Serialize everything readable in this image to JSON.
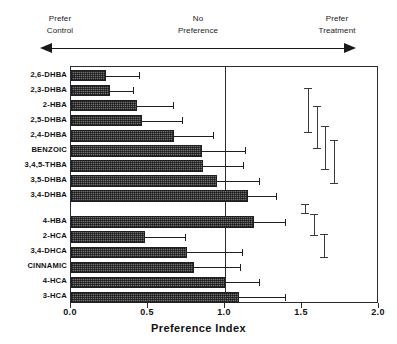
{
  "header": {
    "left_line1": "Prefer",
    "left_line2": "Control",
    "center_line1": "No",
    "center_line2": "Preference",
    "right_line1": "Prefer",
    "right_line2": "Treatment",
    "arrow_left_name": "left-arrow-head",
    "arrow_right_name": "right-arrow-head"
  },
  "chart_data": {
    "type": "bar",
    "orientation": "horizontal",
    "title": "",
    "xlabel": "Preference   Index",
    "ylabel": "",
    "xlim": [
      0.0,
      2.0
    ],
    "xticks": [
      "0.0",
      "0.5",
      "1.0",
      "1.5",
      "2.0"
    ],
    "xtick_values": [
      0.0,
      0.5,
      1.0,
      1.5,
      2.0
    ],
    "grid": false,
    "legend": false,
    "reference_line": 1.0,
    "categories": [
      "2,6-DHBA",
      "2,3-DHBA",
      "2-HBA",
      "2,5-DHBA",
      "2,4-DHBA",
      "BENZOIC",
      "3,4,5-THBA",
      "3,5-DHBA",
      "3,4-DHBA",
      "4-HBA",
      "2-HCA",
      "3,4-DHCA",
      "CINNAMIC",
      "4-HCA",
      "3-HCA"
    ],
    "values": [
      0.23,
      0.25,
      0.43,
      0.46,
      0.67,
      0.85,
      0.86,
      0.95,
      1.15,
      1.19,
      0.48,
      0.75,
      0.8,
      1.0,
      1.09
    ],
    "errors": [
      0.21,
      0.15,
      0.23,
      0.26,
      0.25,
      0.28,
      0.26,
      0.27,
      0.18,
      0.2,
      0.26,
      0.36,
      0.3,
      0.22,
      0.3
    ],
    "group_break_after_index": 9,
    "ci_markers": [
      {
        "x": 1.54,
        "low": 1.45,
        "high": 1.82
      },
      {
        "x": 1.6,
        "low": 1.32,
        "high": 1.67
      },
      {
        "x": 1.65,
        "low": 1.14,
        "high": 1.5
      },
      {
        "x": 1.71,
        "low": 1.02,
        "high": 1.38
      },
      {
        "x": 1.52,
        "low": 0.77,
        "high": 0.84
      },
      {
        "x": 1.58,
        "low": 0.58,
        "high": 0.76
      },
      {
        "x": 1.64,
        "low": 0.4,
        "high": 0.59
      }
    ]
  }
}
